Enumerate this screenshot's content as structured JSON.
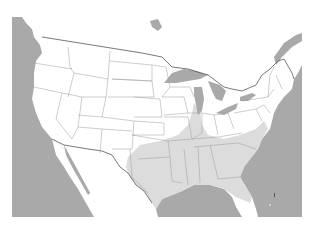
{
  "map": {
    "title": "",
    "region": "Contiguous United States",
    "colors": {
      "water": "#a9a9a9",
      "land": "#ffffff",
      "shaded_region": "#dcdcdc",
      "state_border": "#9a9a9a",
      "national_border": "#555555",
      "background": "#ffffff"
    },
    "layers": [
      {
        "name": "water",
        "description": "Ocean, Gulf of Mexico and Great Lakes in gray"
      },
      {
        "name": "land",
        "description": "US states in white with thin gray borders"
      },
      {
        "name": "shaded_region",
        "description": "Light gray band across the south and southeast, extending up the Mississippi valley"
      }
    ]
  }
}
